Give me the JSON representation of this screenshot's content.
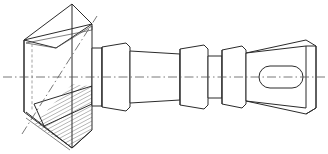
{
  "drawing": {
    "title": "Stepped shaft with conical flange",
    "view": "sectioned side elevation",
    "background_color": "#ffffff",
    "line_color": "#2b2b2b",
    "thin_line_color": "#4a4a4a",
    "hidden_line_color": "#8a8a8a",
    "center_line_color": "#555555",
    "hatch_color": "#3a3a3a",
    "canvas": {
      "width": 328,
      "height": 154
    }
  },
  "geometry": {
    "main_axis": {
      "label": "horizontal centre line",
      "y": 77,
      "x_start": 3,
      "x_end": 325
    },
    "tilted_axis": {
      "label": "cone axis centre line",
      "x1": 22,
      "y1": 134,
      "x2": 97,
      "y2": 16
    },
    "cone": {
      "label": "conical flange (half sectioned)",
      "apex_top_x": 72,
      "apex_top_y": 4,
      "base_left_x": 24,
      "base_left_y": 40,
      "base_bottom_x": 72,
      "base_bottom_y": 148,
      "right_face_x": 92,
      "right_top_y": 24,
      "right_bottom_y": 130,
      "hatched": true,
      "hatch_spacing": 3.4,
      "hatch_angle_deg": 62
    },
    "steps": [
      {
        "name": "neck-collar",
        "x": 92,
        "width": 10,
        "half_height": 29
      },
      {
        "name": "first-collar",
        "x": 102,
        "width": 28,
        "half_height": 34
      },
      {
        "name": "tapered-body",
        "x": 130,
        "width": 50,
        "half_height_left": 26,
        "half_height_right": 23
      },
      {
        "name": "second-collar",
        "x": 180,
        "width": 28,
        "half_height": 32
      },
      {
        "name": "spacer-journal",
        "x": 208,
        "width": 14,
        "half_height": 21
      },
      {
        "name": "third-collar",
        "x": 222,
        "width": 24,
        "half_height": 31
      },
      {
        "name": "end-boss",
        "x": 246,
        "width": 64,
        "half_height": 37
      }
    ],
    "end_slot": {
      "label": "oblong slot in end boss",
      "cx": 281,
      "cy": 77,
      "rx": 22,
      "ry": 11
    },
    "end_face": {
      "label": "rear isometric face of end boss",
      "offset_x": 10,
      "offset_y": -6
    }
  },
  "annotations": {
    "hatch_legend": "section hatching",
    "axis_legend": "centre line"
  }
}
